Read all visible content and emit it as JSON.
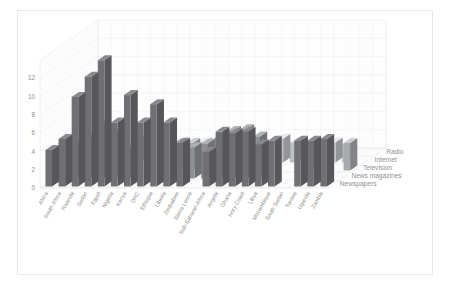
{
  "chart_data": {
    "type": "bar",
    "subtype": "3d-column",
    "title": "",
    "xlabel": "",
    "ylabel": "",
    "ylim": [
      0,
      14
    ],
    "yticks": [
      0,
      2,
      4,
      6,
      8,
      10,
      12
    ],
    "ytick_labels": [
      "0",
      "2",
      "4",
      "6",
      "8",
      "10",
      "12"
    ],
    "grid": true,
    "legend_position": "right-depth-axis",
    "categories": [
      "Africa",
      "South Africa",
      "Rwanda",
      "Sudan",
      "Egypt",
      "Nigeria",
      "Kenya",
      "DRC",
      "Ethiopia",
      "Liberia",
      "Zimbabwe",
      "Sierra Leone",
      "Sub-Saharan Africa",
      "Angola",
      "Ghana",
      "Ivory Coast",
      "Libya",
      "Mozambique",
      "South Sudan",
      "Tunisia",
      "Uganda",
      "Zambia"
    ],
    "series": [
      {
        "name": "Newspapers",
        "values": [
          4.0,
          5.2,
          9.8,
          12.0,
          13.8,
          7.0,
          10.0,
          7.0,
          9.0,
          7.0,
          4.8,
          0,
          3.8,
          6.0,
          5.8,
          6.0,
          4.6,
          5.0,
          0,
          5.0,
          5.0,
          5.2
        ]
      },
      {
        "name": "News magazines",
        "values": [
          0,
          3.6,
          4.4,
          6.0,
          5.0,
          3.2,
          0,
          0,
          0,
          0,
          3.4,
          3.8,
          4.4,
          5.2,
          5.4,
          4.6,
          0,
          0,
          0,
          0,
          0,
          0
        ]
      },
      {
        "name": "Television",
        "values": [
          0,
          0,
          2.2,
          3.4,
          0,
          0,
          0,
          0,
          3.0,
          3.0,
          2.8,
          0,
          2.8,
          0,
          0,
          0,
          0,
          0,
          3.0,
          0,
          0,
          3.0
        ]
      },
      {
        "name": "Internet",
        "values": [
          0,
          0,
          0,
          0,
          2.6,
          0,
          0,
          2.0,
          2.0,
          2.2,
          0,
          0,
          0,
          2.0,
          0,
          2.6,
          2.2,
          0,
          0,
          2.2,
          2.0,
          0
        ]
      },
      {
        "name": "Radio",
        "values": [
          0,
          1.2,
          0,
          0,
          0,
          0,
          0,
          0,
          0,
          0,
          0,
          1.0,
          0,
          0,
          0,
          0,
          0,
          0,
          0,
          0,
          0,
          0
        ]
      }
    ],
    "series_colors": [
      "#6f7074",
      "#8e9094",
      "#a7a9ad",
      "#bdbfc3",
      "#9a9ca0"
    ],
    "palette": "grayscale"
  }
}
